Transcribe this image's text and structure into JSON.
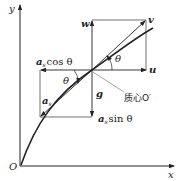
{
  "diagram": {
    "type": "physics-velocity-acceleration-decomposition",
    "axes": {
      "x_label": "x",
      "y_label": "y",
      "origin_label": "O"
    },
    "vectors": {
      "w": "w",
      "v": "v",
      "u": "u",
      "g": "g",
      "a_s": "a",
      "a_s_sub": "s",
      "a_s_cos": "cos θ",
      "a_s_sin": "sin θ"
    },
    "angles": {
      "theta_upper": "θ",
      "theta_lower": "θ"
    },
    "center_label": "质心O′",
    "colors": {
      "stroke": "#222222",
      "background": "#ffffff"
    }
  }
}
